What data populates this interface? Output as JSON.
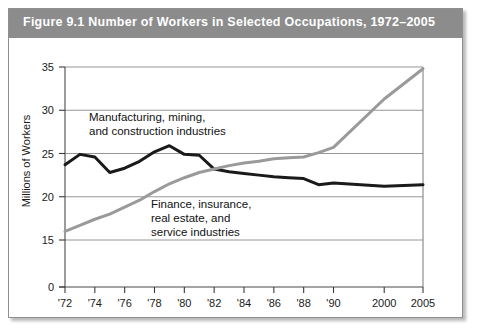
{
  "figure": {
    "title": "Figure 9.1   Number of Workers in Selected Occupations, 1972–2005",
    "title_bg_color": "#8c8c8c",
    "title_text_color": "#ffffff"
  },
  "chart_data": {
    "type": "line",
    "title": "Figure 9.1   Number of Workers in Selected Occupations, 1972–2005",
    "xlabel": "",
    "ylabel": "Millions of Workers",
    "ylim": [
      0,
      35
    ],
    "y_ticks": [
      0,
      15,
      20,
      25,
      30,
      35
    ],
    "y_tick_labels": [
      "0",
      "15",
      "20",
      "25",
      "30",
      "35"
    ],
    "y_axis_broken": true,
    "grid": "horizontal",
    "legend": "inline-annotations",
    "x_ticks": [
      1972,
      1974,
      1976,
      1978,
      1980,
      1982,
      1984,
      1986,
      1988,
      1990,
      2000,
      2005
    ],
    "x_tick_labels": [
      "'72",
      "'74",
      "'76",
      "'78",
      "'80",
      "'82",
      "'84",
      "'86",
      "'88",
      "'90",
      "2000",
      "2005"
    ],
    "x": [
      1972,
      1973,
      1974,
      1975,
      1976,
      1977,
      1978,
      1979,
      1980,
      1981,
      1982,
      1983,
      1984,
      1985,
      1986,
      1987,
      1988,
      1989,
      1990,
      2000,
      2005
    ],
    "series": [
      {
        "name": "Manufacturing, mining, and construction industries",
        "color": "#1a1a1a",
        "line_width": 3,
        "values": [
          23.7,
          24.9,
          24.6,
          22.8,
          23.3,
          24.1,
          25.2,
          25.9,
          24.9,
          24.8,
          23.2,
          22.9,
          22.7,
          22.5,
          22.3,
          22.2,
          22.1,
          21.4,
          21.6,
          21.2,
          21.4
        ]
      },
      {
        "name": "Finance, insurance, real estate, and service industries",
        "color": "#9a9a9a",
        "line_width": 3,
        "values": [
          16.0,
          16.7,
          17.4,
          18.0,
          18.8,
          19.6,
          20.6,
          21.5,
          22.2,
          22.8,
          23.2,
          23.6,
          23.9,
          24.1,
          24.4,
          24.5,
          24.6,
          25.1,
          25.7,
          31.3,
          34.8
        ]
      }
    ],
    "annotations": [
      {
        "name": "manufacturing-label",
        "lines": [
          "Manufacturing, mining,",
          "and construction industries"
        ],
        "x_px": 81,
        "y_px": 113
      },
      {
        "name": "finance-label",
        "lines": [
          "Finance, insurance,",
          "real estate, and",
          "service industries"
        ],
        "x_px": 143,
        "y_px": 200
      }
    ]
  }
}
